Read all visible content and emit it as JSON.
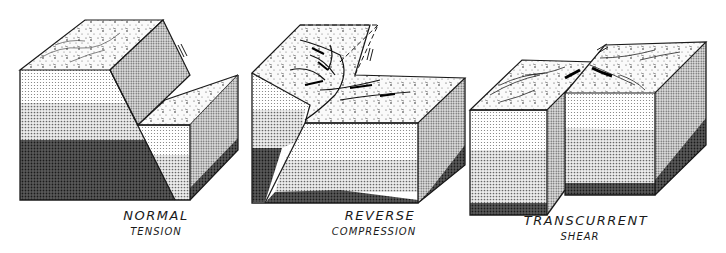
{
  "figure": {
    "type": "fault-types-block-diagram",
    "panels": [
      {
        "id": "normal",
        "title": "NORMAL",
        "subtitle": "TENSION"
      },
      {
        "id": "reverse",
        "title": "REVERSE",
        "subtitle": "COMPRESSION"
      },
      {
        "id": "transcurrent",
        "title": "TRANSCURRENT",
        "subtitle": "SHEAR"
      }
    ]
  },
  "colors": {
    "line": "#1a1a1a",
    "surface": "#f2f2f2",
    "layer_light": "#d9d9d9",
    "layer_mid": "#bdbdbd",
    "layer_dark": "#4a4a4a",
    "side_face": "#b0b0b0",
    "fault_plane": "#c4c4c4"
  }
}
